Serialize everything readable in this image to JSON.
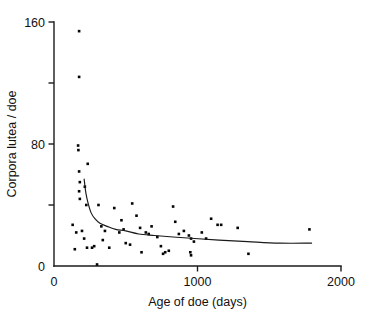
{
  "chart_data": {
    "type": "scatter",
    "title": "",
    "xlabel": "Age of doe (days)",
    "ylabel": "Corpora lutea / doe",
    "xlim": [
      0,
      2000
    ],
    "ylim": [
      0,
      160
    ],
    "grid": false,
    "legend": null,
    "xticks": [
      0,
      1000,
      2000
    ],
    "xtick_labels": [
      "0",
      "1000",
      "2000"
    ],
    "yticks": [
      0,
      40,
      80,
      120,
      160
    ],
    "ytick_labels": [
      "0",
      "",
      "80",
      "",
      "160"
    ],
    "ytick_labels_visible": [
      "0",
      "80",
      "160"
    ],
    "axis_style": "left-and-bottom-spines-with-outward-ticks",
    "marker": "filled-square-dot",
    "points": [
      {
        "x": 175,
        "y": 154
      },
      {
        "x": 175,
        "y": 124
      },
      {
        "x": 168,
        "y": 79
      },
      {
        "x": 170,
        "y": 76
      },
      {
        "x": 175,
        "y": 62
      },
      {
        "x": 235,
        "y": 67
      },
      {
        "x": 180,
        "y": 55
      },
      {
        "x": 175,
        "y": 49
      },
      {
        "x": 215,
        "y": 52
      },
      {
        "x": 180,
        "y": 44
      },
      {
        "x": 225,
        "y": 40
      },
      {
        "x": 130,
        "y": 27
      },
      {
        "x": 155,
        "y": 22
      },
      {
        "x": 195,
        "y": 23
      },
      {
        "x": 210,
        "y": 18
      },
      {
        "x": 230,
        "y": 12
      },
      {
        "x": 265,
        "y": 12
      },
      {
        "x": 280,
        "y": 13
      },
      {
        "x": 145,
        "y": 11
      },
      {
        "x": 300,
        "y": 1
      },
      {
        "x": 310,
        "y": 40
      },
      {
        "x": 330,
        "y": 26
      },
      {
        "x": 340,
        "y": 17
      },
      {
        "x": 355,
        "y": 23
      },
      {
        "x": 385,
        "y": 12
      },
      {
        "x": 420,
        "y": 38
      },
      {
        "x": 455,
        "y": 22
      },
      {
        "x": 470,
        "y": 30
      },
      {
        "x": 485,
        "y": 24
      },
      {
        "x": 500,
        "y": 15
      },
      {
        "x": 530,
        "y": 14
      },
      {
        "x": 545,
        "y": 41
      },
      {
        "x": 575,
        "y": 33
      },
      {
        "x": 600,
        "y": 25
      },
      {
        "x": 610,
        "y": 9
      },
      {
        "x": 640,
        "y": 22
      },
      {
        "x": 660,
        "y": 21
      },
      {
        "x": 680,
        "y": 26
      },
      {
        "x": 720,
        "y": 19
      },
      {
        "x": 745,
        "y": 13
      },
      {
        "x": 760,
        "y": 8
      },
      {
        "x": 775,
        "y": 9
      },
      {
        "x": 800,
        "y": 10
      },
      {
        "x": 830,
        "y": 39
      },
      {
        "x": 845,
        "y": 29
      },
      {
        "x": 870,
        "y": 21
      },
      {
        "x": 905,
        "y": 23
      },
      {
        "x": 940,
        "y": 20
      },
      {
        "x": 955,
        "y": 18
      },
      {
        "x": 950,
        "y": 9
      },
      {
        "x": 955,
        "y": 7
      },
      {
        "x": 975,
        "y": 16
      },
      {
        "x": 1030,
        "y": 22
      },
      {
        "x": 1060,
        "y": 18
      },
      {
        "x": 1095,
        "y": 31
      },
      {
        "x": 1140,
        "y": 27
      },
      {
        "x": 1165,
        "y": 27
      },
      {
        "x": 1280,
        "y": 25
      },
      {
        "x": 1355,
        "y": 8
      },
      {
        "x": 1780,
        "y": 24
      }
    ],
    "fit_curve": {
      "description": "decreasing power/inverse fit line through scatter",
      "x_start": 210,
      "x_end": 1795,
      "y_start": 57,
      "y_end": 15,
      "points": [
        {
          "x": 210,
          "y": 57
        },
        {
          "x": 222,
          "y": 48
        },
        {
          "x": 238,
          "y": 41
        },
        {
          "x": 258,
          "y": 35
        },
        {
          "x": 285,
          "y": 31
        },
        {
          "x": 320,
          "y": 28
        },
        {
          "x": 370,
          "y": 26
        },
        {
          "x": 430,
          "y": 24
        },
        {
          "x": 500,
          "y": 23
        },
        {
          "x": 590,
          "y": 21
        },
        {
          "x": 700,
          "y": 20
        },
        {
          "x": 830,
          "y": 19
        },
        {
          "x": 980,
          "y": 18
        },
        {
          "x": 1150,
          "y": 17
        },
        {
          "x": 1350,
          "y": 16
        },
        {
          "x": 1570,
          "y": 15
        },
        {
          "x": 1795,
          "y": 15
        }
      ]
    }
  },
  "colors": {
    "axis": "#1a1a1a",
    "point": "#050505",
    "curve": "#1a1a1a",
    "background": "#ffffff"
  }
}
